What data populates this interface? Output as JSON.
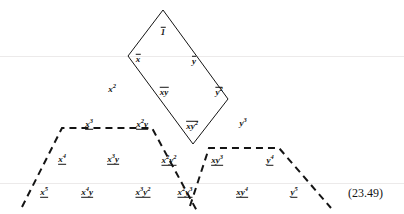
{
  "figure": {
    "equation_number": "(23.49)",
    "equation_number_x": 348,
    "equation_number_y": 186,
    "width": 404,
    "height": 214,
    "background_color": "#ffffff",
    "ink_color": "#141414",
    "faint_rule_color": "#eceaea"
  },
  "shapes": {
    "diamond": {
      "name": "solid-diamond",
      "style": "solid",
      "stroke": "#141414",
      "stroke_width": 1,
      "points": "163,10 128,56 193,144 228,99"
    },
    "left_trapezoid": {
      "name": "left-dashed-trapezoid",
      "style": "dashed",
      "stroke": "#141414",
      "stroke_width": 2,
      "dash": "7,5",
      "points": "22,207 62,128 152,128 197,211"
    },
    "right_trapezoid": {
      "name": "right-dashed-trapezoid",
      "style": "dashed",
      "stroke": "#141414",
      "stroke_width": 2,
      "dash": "7,5",
      "points": "190,206 209,148 279,148 331,208"
    },
    "faint_rules": [
      {
        "name": "faint-rule-upper",
        "y": 56
      },
      {
        "name": "faint-rule-lower",
        "y": 183
      }
    ]
  },
  "monomials": [
    {
      "id": "m-1",
      "base": "1",
      "x_exp": "",
      "y_exp": "",
      "decoration": "overbar",
      "x": 163,
      "y": 32,
      "degree": 0
    },
    {
      "id": "m-x",
      "base": "x",
      "x_exp": "",
      "y_exp": "",
      "decoration": "overbar",
      "x": 138,
      "y": 59,
      "degree": 1
    },
    {
      "id": "m-y",
      "base": "y",
      "x_exp": "",
      "y_exp": "",
      "decoration": "overbar",
      "x": 194,
      "y": 61,
      "degree": 1
    },
    {
      "id": "m-x2",
      "base": "x",
      "x_exp": "2",
      "y_exp": "",
      "decoration": "none",
      "x": 112,
      "y": 90,
      "degree": 2
    },
    {
      "id": "m-xy",
      "base": "xy",
      "x_exp": "",
      "y_exp": "",
      "decoration": "overbar",
      "x": 164,
      "y": 92,
      "degree": 2
    },
    {
      "id": "m-y2",
      "base": "y",
      "x_exp": "",
      "y_exp": "2",
      "decoration": "overbar",
      "x": 219,
      "y": 92,
      "degree": 2
    },
    {
      "id": "m-x3",
      "base": "x",
      "x_exp": "3",
      "y_exp": "",
      "decoration": "underline",
      "x": 89,
      "y": 125,
      "degree": 3
    },
    {
      "id": "m-x2y",
      "base": "x",
      "x_exp": "2",
      "y_exp": "1",
      "decoration": "underline",
      "x": 142,
      "y": 125,
      "degree": 3
    },
    {
      "id": "m-xy2",
      "base": "xy",
      "x_exp": "",
      "y_exp": "2",
      "decoration": "overbar",
      "x": 192,
      "y": 126,
      "degree": 3
    },
    {
      "id": "m-y3",
      "base": "y",
      "x_exp": "",
      "y_exp": "3",
      "decoration": "none",
      "x": 243,
      "y": 124,
      "degree": 3
    },
    {
      "id": "m-x4",
      "base": "x",
      "x_exp": "4",
      "y_exp": "",
      "decoration": "underline",
      "x": 62,
      "y": 160,
      "degree": 4
    },
    {
      "id": "m-x3y",
      "base": "x",
      "x_exp": "3",
      "y_exp": "1",
      "decoration": "underline",
      "x": 113,
      "y": 160,
      "degree": 4
    },
    {
      "id": "m-x2y2",
      "base": "x",
      "x_exp": "2",
      "y_exp": "2",
      "decoration": "underline",
      "x": 169,
      "y": 161,
      "degree": 4
    },
    {
      "id": "m-xy3",
      "base": "xy",
      "x_exp": "",
      "y_exp": "3",
      "decoration": "underline",
      "x": 217,
      "y": 161,
      "degree": 4
    },
    {
      "id": "m-y4",
      "base": "y",
      "x_exp": "",
      "y_exp": "4",
      "decoration": "underline",
      "x": 270,
      "y": 161,
      "degree": 4
    },
    {
      "id": "m-x5",
      "base": "x",
      "x_exp": "5",
      "y_exp": "",
      "decoration": "underline",
      "x": 44,
      "y": 193,
      "degree": 5
    },
    {
      "id": "m-x4y",
      "base": "x",
      "x_exp": "4",
      "y_exp": "1",
      "decoration": "underline",
      "x": 87,
      "y": 193,
      "degree": 5
    },
    {
      "id": "m-x3y2",
      "base": "x",
      "x_exp": "3",
      "y_exp": "2",
      "decoration": "underline",
      "x": 143,
      "y": 193,
      "degree": 5
    },
    {
      "id": "m-x2y3",
      "base": "x",
      "x_exp": "2",
      "y_exp": "3",
      "decoration": "underline",
      "x": 185,
      "y": 193,
      "degree": 5
    },
    {
      "id": "m-xy4",
      "base": "xy",
      "x_exp": "",
      "y_exp": "4",
      "decoration": "underline",
      "x": 242,
      "y": 193,
      "degree": 5
    },
    {
      "id": "m-y5",
      "base": "y",
      "x_exp": "",
      "y_exp": "5",
      "decoration": "underline",
      "x": 294,
      "y": 193,
      "degree": 5
    }
  ]
}
